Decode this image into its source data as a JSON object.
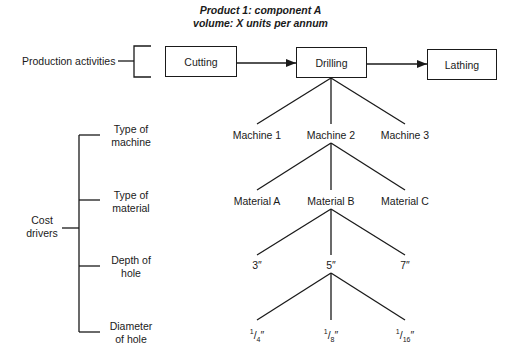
{
  "title": {
    "line1": "Product 1: component A",
    "line2": "volume: X units per annum"
  },
  "production": {
    "label": "Production activities",
    "activities": [
      "Cutting",
      "Drilling",
      "Lathing"
    ]
  },
  "cost_drivers": {
    "label_line1": "Cost",
    "label_line2": "drivers",
    "drivers": [
      {
        "line1": "Type of",
        "line2": "machine",
        "options": [
          "Machine 1",
          "Machine 2",
          "Machine 3"
        ]
      },
      {
        "line1": "Type of",
        "line2": "material",
        "options": [
          "Material A",
          "Material B",
          "Material C"
        ]
      },
      {
        "line1": "Depth of",
        "line2": "hole",
        "options": [
          "3″",
          "5″",
          "7″"
        ]
      },
      {
        "line1": "Diameter",
        "line2": "of hole",
        "options": [
          "1/4″",
          "1/8″",
          "1/16″"
        ]
      }
    ]
  },
  "diameter_fractions": [
    {
      "num": "1",
      "den": "4"
    },
    {
      "num": "1",
      "den": "8"
    },
    {
      "num": "1",
      "den": "16"
    }
  ]
}
